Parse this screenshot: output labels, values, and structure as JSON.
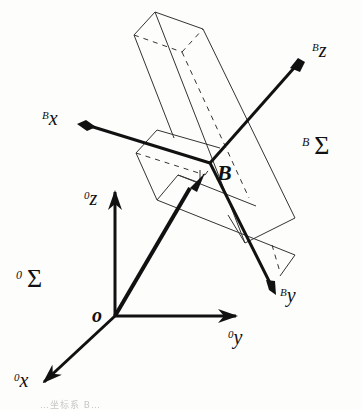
{
  "diagram": {
    "type": "coordinate-frames",
    "world_frame": {
      "name": "0Σ",
      "label_superscript": "0",
      "label_symbol": "Σ",
      "origin_label": "o",
      "axes": [
        {
          "name": "x",
          "superscript": "0",
          "label": "x"
        },
        {
          "name": "y",
          "superscript": "0",
          "label": "y"
        },
        {
          "name": "z",
          "superscript": "0",
          "label": "z"
        }
      ]
    },
    "body_frame": {
      "name": "BΣ",
      "label_superscript": "B",
      "label_symbol": "Σ",
      "origin_label": "B",
      "axes": [
        {
          "name": "x",
          "superscript": "B",
          "label": "x"
        },
        {
          "name": "y",
          "superscript": "B",
          "label": "y"
        },
        {
          "name": "z",
          "superscript": "B",
          "label": "z"
        }
      ]
    },
    "object": "rectangular bars (wireframe box with hidden edges dashed)",
    "caption_partial": "…坐标系 B…"
  },
  "colors": {
    "background": "#fdfdfb",
    "ink": "#111111",
    "box_line": "#333333"
  }
}
